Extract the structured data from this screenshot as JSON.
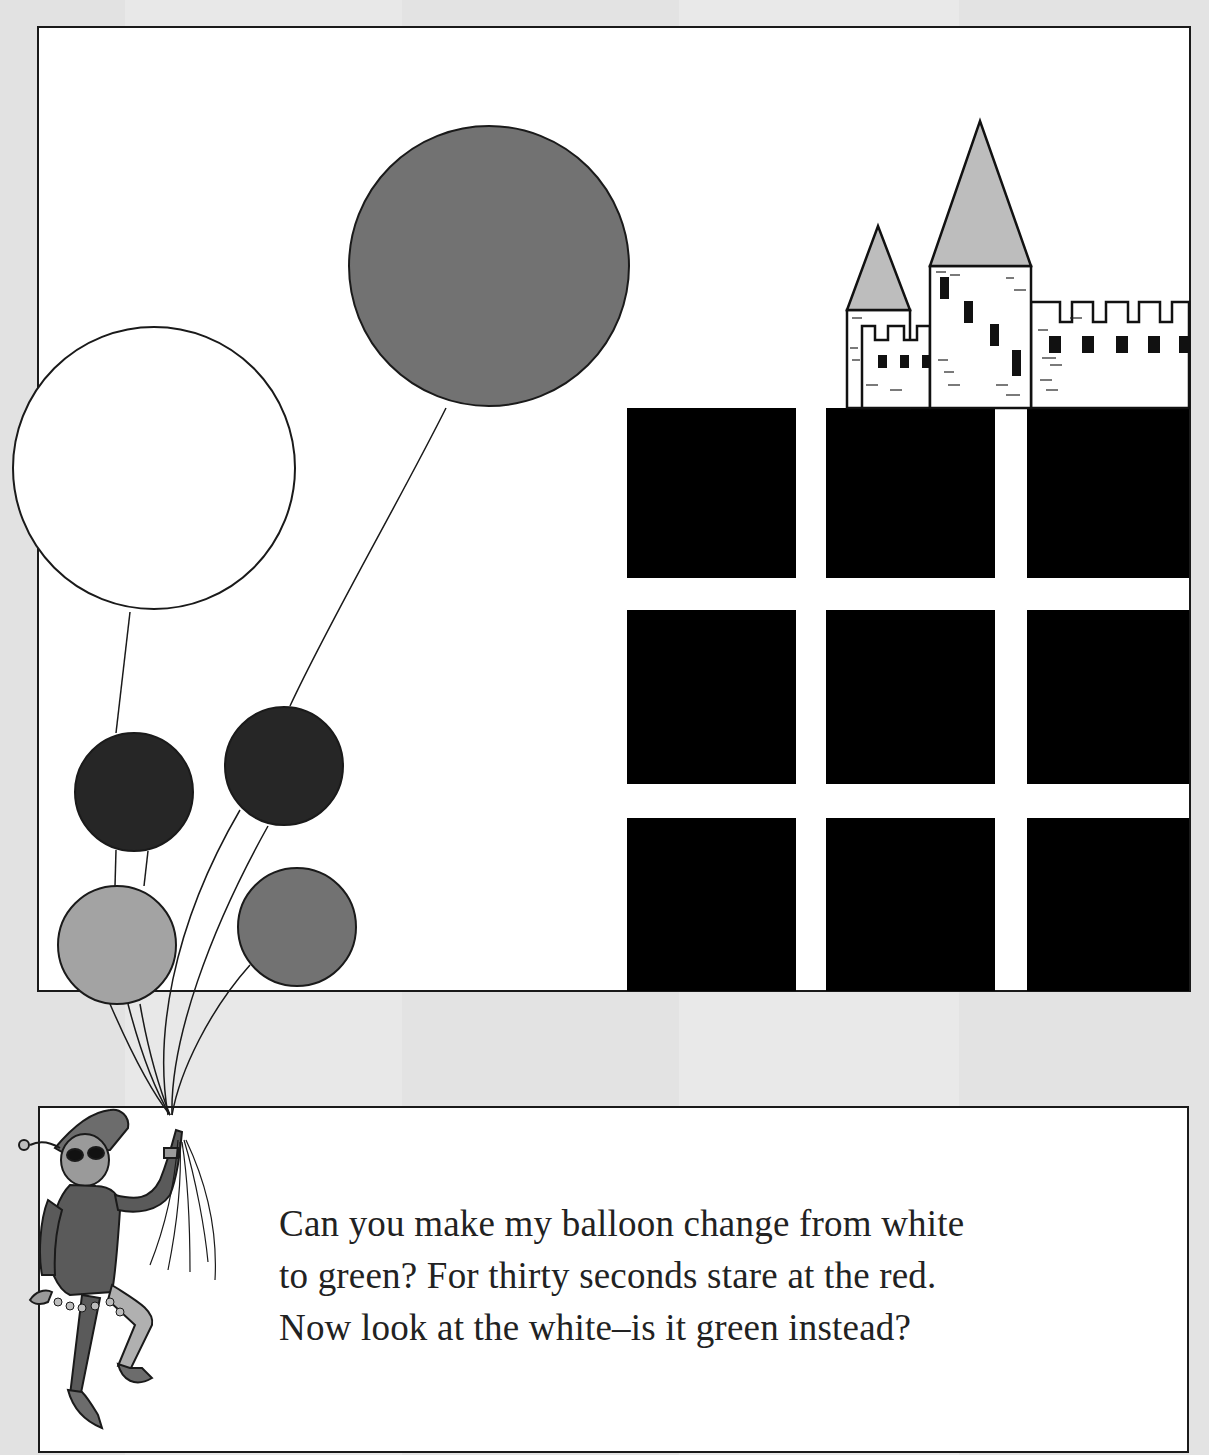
{
  "page": {
    "background": "#e4e4e4"
  },
  "scene": {
    "balloons": [
      {
        "id": "big-gray",
        "cx": 489,
        "cy": 266,
        "r": 140,
        "fill": "#727272"
      },
      {
        "id": "white",
        "cx": 154,
        "cy": 468,
        "r": 141,
        "fill": "#ffffff"
      },
      {
        "id": "dark-left",
        "cx": 134,
        "cy": 792,
        "r": 59,
        "fill": "#262626"
      },
      {
        "id": "dark-right",
        "cx": 284,
        "cy": 766,
        "r": 59,
        "fill": "#262626"
      },
      {
        "id": "light-gray",
        "cx": 117,
        "cy": 945,
        "r": 59,
        "fill": "#a3a3a3"
      },
      {
        "id": "medium-gray",
        "cx": 297,
        "cy": 927,
        "r": 59,
        "fill": "#727272"
      }
    ],
    "grid": {
      "color": "#000000",
      "columns": [
        [
          627,
          796
        ],
        [
          826,
          995
        ],
        [
          1027,
          1189
        ]
      ],
      "rows": [
        [
          408,
          578
        ],
        [
          610,
          784
        ],
        [
          818,
          990
        ]
      ]
    },
    "castle": {
      "spire_color": "#bdbdbd"
    }
  },
  "caption": {
    "lines": [
      "Can you make my balloon change from white",
      "to green? For thirty seconds stare at the red.",
      "Now look at the white–is it green instead?"
    ]
  }
}
